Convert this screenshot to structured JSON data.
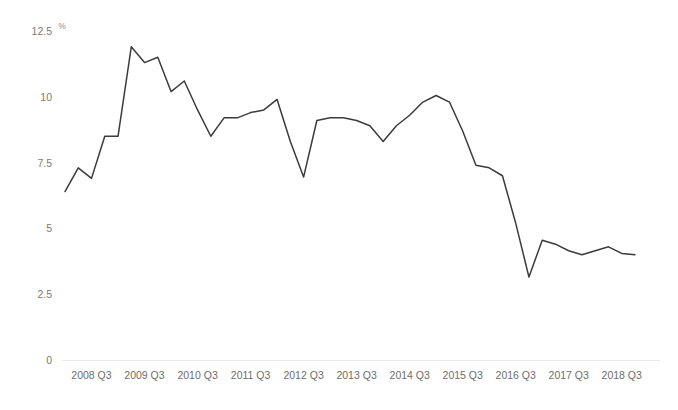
{
  "chart_data": {
    "type": "line",
    "title": "",
    "subtitle": "",
    "xlabel": "",
    "ylabel": "",
    "unit_label": "%",
    "ylim": [
      0,
      12.5
    ],
    "y_ticks": [
      0,
      2.5,
      5,
      7.5,
      10,
      12.5
    ],
    "y_tick_labels": [
      "0",
      "2.5",
      "5",
      "7.5",
      "10",
      "12.5"
    ],
    "x_tick_labels": [
      "2008 Q3",
      "2009 Q3",
      "2010 Q3",
      "2011 Q3",
      "2012 Q3",
      "2013 Q3",
      "2014 Q3",
      "2015 Q3",
      "2016 Q3",
      "2017 Q3",
      "2018 Q3"
    ],
    "grid": false,
    "legend": false,
    "legend_position": "none",
    "line_color": "#3b3b3b",
    "axis_color": "#e9e9e9",
    "tick_label_color": "#6d6d6d",
    "x": [
      "2008 Q1",
      "2008 Q2",
      "2008 Q3",
      "2008 Q4",
      "2009 Q1",
      "2009 Q2",
      "2009 Q3",
      "2009 Q4",
      "2010 Q1",
      "2010 Q2",
      "2010 Q3",
      "2010 Q4",
      "2011 Q1",
      "2011 Q2",
      "2011 Q3",
      "2011 Q4",
      "2012 Q1",
      "2012 Q2",
      "2012 Q3",
      "2012 Q4",
      "2013 Q1",
      "2013 Q2",
      "2013 Q3",
      "2013 Q4",
      "2014 Q1",
      "2014 Q2",
      "2014 Q3",
      "2014 Q4",
      "2015 Q1",
      "2015 Q2",
      "2015 Q3",
      "2015 Q4",
      "2016 Q1",
      "2016 Q2",
      "2016 Q3",
      "2016 Q4",
      "2017 Q1",
      "2017 Q2",
      "2017 Q3",
      "2017 Q4",
      "2018 Q1",
      "2018 Q2",
      "2018 Q3",
      "2018 Q4"
    ],
    "series": [
      {
        "name": "Rate",
        "values": [
          6.4,
          7.3,
          6.9,
          8.5,
          8.5,
          11.9,
          11.3,
          11.5,
          10.2,
          10.6,
          9.5,
          8.5,
          9.2,
          9.2,
          9.4,
          9.5,
          9.9,
          8.3,
          6.95,
          9.1,
          9.2,
          9.2,
          9.1,
          8.9,
          8.3,
          8.9,
          9.3,
          9.8,
          10.05,
          9.8,
          8.7,
          7.4,
          7.3,
          7.0,
          5.2,
          3.15,
          4.55,
          4.4,
          4.15,
          4.0,
          4.15,
          4.3,
          4.05,
          4.0
        ]
      }
    ]
  }
}
